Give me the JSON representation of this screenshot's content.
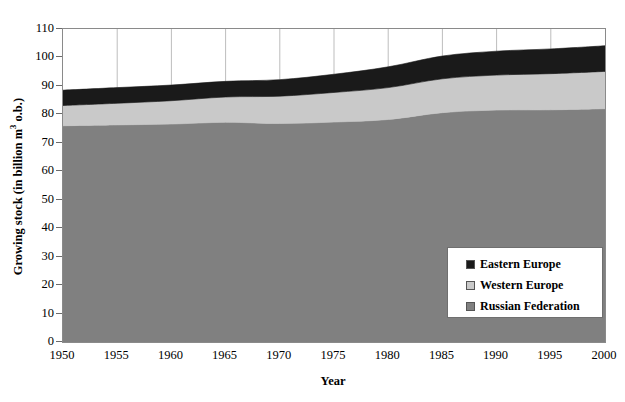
{
  "caption_remnant": "    ",
  "chart_data": {
    "type": "area",
    "title": "",
    "subtitle": "",
    "xlabel": "Year",
    "ylabel": "Growing stock (in billion m³ o.b.)",
    "ylabel_parts": {
      "before": "Growing stock (in billion m",
      "sup": "3",
      "after": " o.b.)"
    },
    "xlim": [
      1950,
      2000
    ],
    "ylim": [
      0,
      110
    ],
    "ytick_labels": [
      "0",
      "10",
      "20",
      "30",
      "40",
      "50",
      "60",
      "70",
      "80",
      "90",
      "100",
      "110"
    ],
    "ytick_values": [
      0,
      10,
      20,
      30,
      40,
      50,
      60,
      70,
      80,
      90,
      100,
      110
    ],
    "xtick_labels": [
      "1950",
      "1955",
      "1960",
      "1965",
      "1970",
      "1975",
      "1980",
      "1985",
      "1990",
      "1995",
      "2000"
    ],
    "xtick_values": [
      1950,
      1955,
      1960,
      1965,
      1970,
      1975,
      1980,
      1985,
      1990,
      1995,
      2000
    ],
    "grid": {
      "vertical": true,
      "horizontal": false,
      "color": "#bdbdbd"
    },
    "stacked": true,
    "stack_order": [
      "Russian Federation",
      "Western Europe",
      "Eastern Europe"
    ],
    "x": [
      1950,
      1955,
      1960,
      1965,
      1970,
      1975,
      1980,
      1985,
      1990,
      1995,
      2000
    ],
    "series": [
      {
        "name": "Russian Federation",
        "color": "#808080",
        "values": [
          76.0,
          76.3,
          76.6,
          77.2,
          76.8,
          77.3,
          78.2,
          80.6,
          81.5,
          81.6,
          82.0
        ]
      },
      {
        "name": "Western Europe",
        "color": "#c9c9c9",
        "values": [
          7.1,
          7.6,
          8.2,
          8.9,
          9.6,
          10.4,
          11.2,
          11.9,
          12.3,
          12.7,
          13.1
        ]
      },
      {
        "name": "Eastern Europe",
        "color": "#1a1a1a",
        "values": [
          5.4,
          5.5,
          5.5,
          5.5,
          5.8,
          6.4,
          7.3,
          8.0,
          8.4,
          8.7,
          9.0
        ]
      }
    ],
    "cumulative_totals": [
      88.5,
      89.4,
      90.3,
      91.6,
      92.2,
      94.1,
      96.7,
      100.5,
      102.2,
      103.0,
      104.1
    ],
    "legend": {
      "position": "inside-lower-right",
      "entries": [
        {
          "label": "Eastern Europe",
          "color": "#1a1a1a"
        },
        {
          "label": "Western Europe",
          "color": "#c9c9c9"
        },
        {
          "label": "Russian Federation",
          "color": "#808080"
        }
      ]
    }
  }
}
